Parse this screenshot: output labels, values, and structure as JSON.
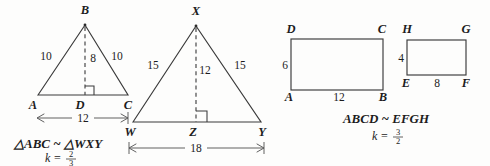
{
  "figure": {
    "background_color": "#fdfdfc",
    "ink_color": "#1c1c1c"
  },
  "triangle_abc": {
    "vertices": {
      "apex": "B",
      "left": "A",
      "right": "C",
      "foot": "D"
    },
    "labels": {
      "apex": "B",
      "left": "A",
      "right": "C",
      "foot": "D"
    },
    "side_left": "10",
    "side_right": "10",
    "altitude": "8",
    "base_dimension": "12"
  },
  "triangle_wxy": {
    "vertices": {
      "apex": "X",
      "left": "W",
      "right": "Y",
      "foot": "Z"
    },
    "labels": {
      "apex": "X",
      "left": "W",
      "right": "Y",
      "foot": "Z"
    },
    "side_left": "15",
    "side_right": "15",
    "altitude": "12",
    "base_dimension": "18"
  },
  "triangle_similarity": {
    "statement": "△ABC ~ △WXY",
    "scale_label": "k =",
    "scale_numerator": "2",
    "scale_denominator": "3"
  },
  "rectangle_abcd": {
    "labels": {
      "bottom_left": "A",
      "bottom_right": "B",
      "top_right": "C",
      "top_left": "D"
    },
    "height_label": "6",
    "width_label": "12"
  },
  "rectangle_efgh": {
    "labels": {
      "bottom_left": "E",
      "bottom_right": "F",
      "top_right": "G",
      "top_left": "H"
    },
    "height_label": "4",
    "width_label": "8"
  },
  "rectangle_similarity": {
    "statement": "ABCD ~ EFGH",
    "scale_label": "k =",
    "scale_numerator": "3",
    "scale_denominator": "2"
  }
}
